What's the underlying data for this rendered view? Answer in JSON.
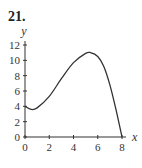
{
  "problem_number": "21.",
  "chart_data": {
    "type": "line",
    "title": "",
    "xlabel": "x",
    "ylabel": "y",
    "xlim": [
      0,
      8
    ],
    "ylim": [
      0,
      12
    ],
    "grid": false,
    "legend": null,
    "x_ticks": [
      "0",
      "2",
      "4",
      "6",
      "8"
    ],
    "y_ticks": [
      "0",
      "2",
      "4",
      "6",
      "8",
      "10",
      "12"
    ],
    "series": [
      {
        "name": "f(x)",
        "x": [
          0,
          0.5,
          1,
          2,
          3,
          4,
          5,
          5.4,
          6,
          6.5,
          7,
          7.5,
          8
        ],
        "y": [
          4.0,
          3.6,
          3.8,
          5.3,
          7.6,
          9.7,
          10.9,
          11.0,
          10.5,
          9.2,
          6.8,
          3.6,
          0
        ],
        "color": "#333333"
      }
    ]
  }
}
